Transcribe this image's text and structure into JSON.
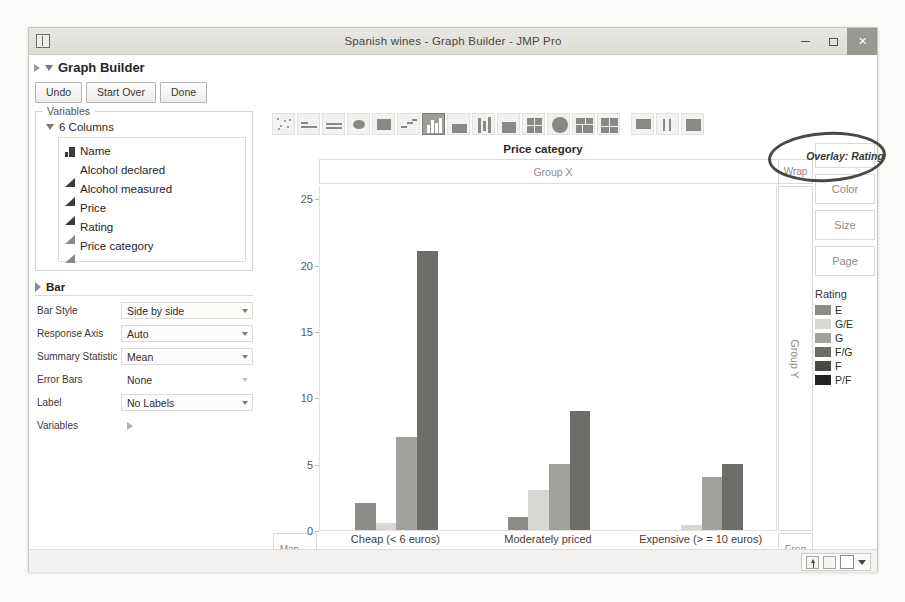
{
  "window": {
    "title": "Spanish wines - Graph Builder - JMP Pro",
    "minimize_label": "Minimize",
    "maximize_label": "Maximize",
    "close_label": "✕"
  },
  "platform": {
    "title": "Graph Builder",
    "buttons": [
      {
        "label": "Undo"
      },
      {
        "label": "Start Over"
      },
      {
        "label": "Done"
      }
    ]
  },
  "variables_panel": {
    "legend": "Variables",
    "columns_header": "6 Columns",
    "columns": [
      {
        "name": "Name",
        "icon": "nominal-bars-icon"
      },
      {
        "name": "Alcohol declared",
        "icon": "continuous-triangle-icon"
      },
      {
        "name": "Alcohol measured",
        "icon": "continuous-triangle-icon"
      },
      {
        "name": "Price",
        "icon": "continuous-triangle-icon"
      },
      {
        "name": "Rating",
        "icon": "ordinal-triangle-icon"
      },
      {
        "name": "Price category",
        "icon": "ordinal-triangle-icon"
      }
    ]
  },
  "bar_section": {
    "title": "Bar",
    "properties": [
      {
        "label": "Bar Style",
        "value": "Side by side",
        "has_caret": true
      },
      {
        "label": "Response Axis",
        "value": "Auto",
        "has_caret": true
      },
      {
        "label": "Summary Statistic",
        "value": "Mean",
        "has_caret": true
      },
      {
        "label": "Error Bars",
        "value": "None",
        "has_caret": true
      },
      {
        "label": "Label",
        "value": "No Labels",
        "has_caret": true
      },
      {
        "label": "Variables",
        "value": "",
        "has_caret": false
      }
    ]
  },
  "toolbar": {
    "icons": [
      {
        "name": "points-icon",
        "selected": false
      },
      {
        "name": "smoother-icon",
        "selected": false
      },
      {
        "name": "line-of-fit-icon",
        "selected": false
      },
      {
        "name": "ellipse-icon",
        "selected": false
      },
      {
        "name": "contour-icon",
        "selected": false
      },
      {
        "name": "line-chart-icon",
        "selected": false
      },
      {
        "name": "bar-chart-icon",
        "selected": true
      },
      {
        "name": "area-chart-icon",
        "selected": false
      },
      {
        "name": "box-plot-icon",
        "selected": false
      },
      {
        "name": "histogram-icon",
        "selected": false
      },
      {
        "name": "heatmap-icon",
        "selected": false
      },
      {
        "name": "pie-chart-icon",
        "selected": false
      },
      {
        "name": "treemap-icon",
        "selected": false
      },
      {
        "name": "mosaic-icon",
        "selected": false
      },
      {
        "name": "caption-box-icon",
        "selected": false
      },
      {
        "name": "formula-icon",
        "selected": false
      },
      {
        "name": "map-shapes-icon",
        "selected": false
      }
    ]
  },
  "chart_drop_zones": {
    "group_x": "Group X",
    "wrap": "Wrap",
    "group_y": "Group Y",
    "freq": "Freq",
    "map": "Map ...",
    "overlay": "Overlay: Rating",
    "color": "Color",
    "size": "Size",
    "page": "Page"
  },
  "legend": {
    "title": "Rating",
    "items": [
      {
        "label": "E",
        "color": "#8d8b87"
      },
      {
        "label": "G/E",
        "color": "#d9d7d3"
      },
      {
        "label": "G",
        "color": "#a3a19d"
      },
      {
        "label": "F/G",
        "color": "#6f6d69"
      },
      {
        "label": "F",
        "color": "#4a4845"
      },
      {
        "label": "P/F",
        "color": "#232220"
      }
    ]
  },
  "chart_data": {
    "type": "bar",
    "title": "Price category",
    "xlabel": "Price category",
    "ylabel": "",
    "ylim": [
      0,
      26
    ],
    "yticks": [
      0,
      5,
      10,
      15,
      20,
      25
    ],
    "grid": false,
    "legend_position": "right",
    "legend_title": "Rating",
    "categories": [
      "Cheap (< 6 euros)",
      "Moderately priced",
      "Expensive (> = 10 euros)"
    ],
    "series": [
      {
        "name": "E",
        "color": "#8d8b87",
        "values": [
          2.0,
          1.0,
          0.0
        ]
      },
      {
        "name": "G/E",
        "color": "#d9d7d3",
        "values": [
          0.5,
          3.0,
          0.4
        ]
      },
      {
        "name": "G",
        "color": "#a3a19d",
        "values": [
          7.0,
          5.0,
          4.0
        ]
      },
      {
        "name": "F/G",
        "color": "#6f6d69",
        "values": [
          21.0,
          9.0,
          5.0
        ]
      }
    ]
  },
  "statusbar": {
    "tools": [
      "export-up-icon",
      "copy-icon",
      "blank-square-icon",
      "dropdown-caret-icon"
    ]
  }
}
